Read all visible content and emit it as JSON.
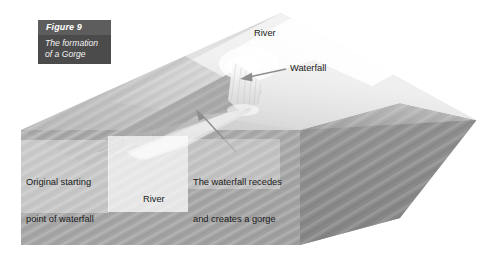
{
  "figure": {
    "number": "Figure 9",
    "subtitle_line1": "The formation",
    "subtitle_line2": "of a Gorge",
    "subtitle": "The formation of a Gorge"
  },
  "labels": {
    "river_top": "River",
    "waterfall": "Waterfall",
    "original_point_line1": "Original starting",
    "original_point_line2": "point of waterfall",
    "river_bottom": "River",
    "recedes_line1": "The waterfall recedes",
    "recedes_line2": "and creates a gorge"
  },
  "colors": {
    "caption_background": "#4b4b4b",
    "caption_band": "#5d5d5d",
    "caption_text": "#ffffff",
    "label_text": "#1a1a1a",
    "block_top_surface": "#d9d9d9",
    "block_right_face": "#8f8f8f",
    "block_front_face": "#a8a8a8",
    "river_highlight": "#fafafa",
    "arrow": "#8a8a8a",
    "page_background": "#ffffff"
  },
  "diagram": {
    "type": "block-diagram",
    "subject": "The formation of a Gorge",
    "elements": [
      "3d landscape block",
      "river channel on top surface",
      "waterfall notch",
      "gorge cut into block",
      "original starting point dotted line"
    ]
  }
}
